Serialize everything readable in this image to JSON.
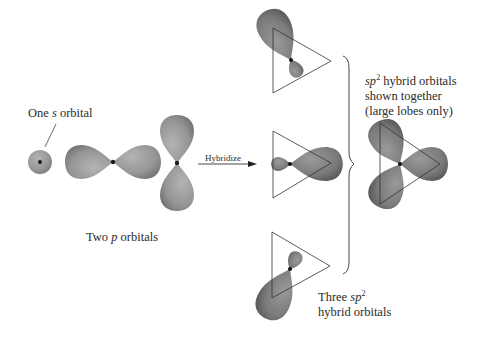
{
  "labels": {
    "s_orbital": {
      "pre": "One ",
      "italic": "s",
      "post": " orbital"
    },
    "p_orbitals": {
      "pre": "Two ",
      "italic": "p",
      "post": " orbitals"
    },
    "hybridize": "Hybridize",
    "three_sp2": {
      "line1_pre": "Three ",
      "italic": "sp",
      "sup": "2",
      "line2": "hybrid orbitals"
    },
    "together": {
      "italic": "sp",
      "sup": "2",
      "line1_post": " hybrid orbitals",
      "line2": "shown together",
      "line3": "(large lobes only)"
    }
  },
  "colors": {
    "orbital_fill": "#9a9a9a",
    "orbital_dark": "#6f6f6f",
    "nucleus": "#1a1a1a",
    "line": "#333333"
  }
}
